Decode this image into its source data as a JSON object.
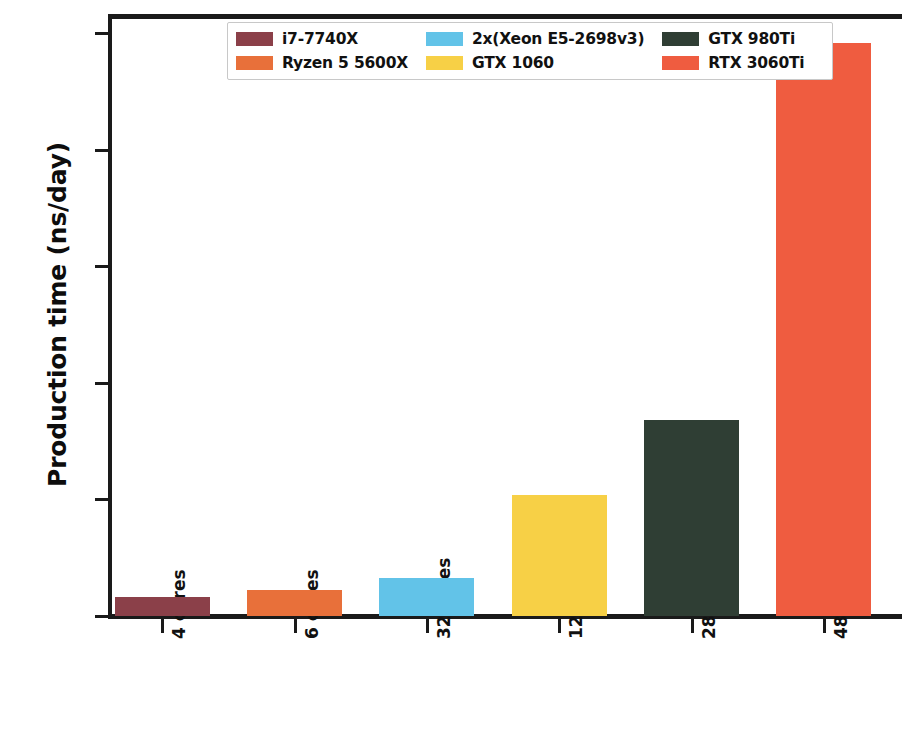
{
  "chart_data": {
    "type": "bar",
    "title": "",
    "xlabel": "",
    "ylabel": "Production time (ns/day)",
    "categories": [
      "4 cores",
      "6 cores",
      "32 cores",
      "1280 cores",
      "2816 cores",
      "4864 cores"
    ],
    "series_names": [
      "i7-7740X",
      "Ryzen 5 5600X",
      "2x(Xeon E5-2698v3)",
      "GTX 1060",
      "GTX 980Ti",
      "RTX 3060Ti"
    ],
    "values": [
      33,
      45,
      66,
      207,
      337,
      983
    ],
    "colors": [
      "#8B4049",
      "#E8703A",
      "#62C3E8",
      "#F7D046",
      "#2F3E34",
      "#EF5C40"
    ],
    "ylim": [
      0,
      1030
    ],
    "yticks": [
      0,
      200,
      400,
      600,
      800,
      1000
    ],
    "ytick_labels": [
      "0",
      "200",
      "400",
      "600",
      "800",
      "1000"
    ],
    "grid": false,
    "legend_position": "upper center",
    "legend_columns": 3,
    "bars": [
      {
        "category": "4 cores",
        "label": "i7-7740X",
        "value": 33,
        "color": "#8B4049"
      },
      {
        "category": "6 cores",
        "label": "Ryzen 5 5600X",
        "value": 45,
        "color": "#E8703A"
      },
      {
        "category": "32 cores",
        "label": "2x(Xeon E5-2698v3)",
        "value": 66,
        "color": "#62C3E8"
      },
      {
        "category": "1280 cores",
        "label": "GTX 1060",
        "value": 207,
        "color": "#F7D046"
      },
      {
        "category": "2816 cores",
        "label": "GTX 980Ti",
        "value": 337,
        "color": "#2F3E34"
      },
      {
        "category": "4864 cores",
        "label": "RTX 3060Ti",
        "value": 983,
        "color": "#EF5C40"
      }
    ]
  },
  "legend": {
    "columns": [
      [
        {
          "label": "i7-7740X",
          "color": "#8B4049"
        },
        {
          "label": "Ryzen 5 5600X",
          "color": "#E8703A"
        }
      ],
      [
        {
          "label": "2x(Xeon E5-2698v3)",
          "color": "#62C3E8"
        },
        {
          "label": "GTX 1060",
          "color": "#F7D046"
        }
      ],
      [
        {
          "label": "GTX 980Ti",
          "color": "#2F3E34"
        },
        {
          "label": "RTX 3060Ti",
          "color": "#EF5C40"
        }
      ]
    ]
  },
  "axes": {
    "y_title": "Production time (ns/day)",
    "y_ticks": [
      "0",
      "200",
      "400",
      "600",
      "800",
      "1000"
    ],
    "x_ticks": [
      "4 cores",
      "6 cores",
      "32 cores",
      "1280 cores",
      "2816 cores",
      "4864 cores"
    ]
  }
}
